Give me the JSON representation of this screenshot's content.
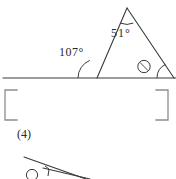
{
  "figure": {
    "part_label": "(4)",
    "triangle": {
      "apex_angle_label": "51°",
      "exterior_angle_label": "107°",
      "right_vertex_marker": "ⓑ",
      "apex": {
        "x": 127,
        "y": 8
      },
      "left_vertex": {
        "x": 97,
        "y": 78
      },
      "right_vertex": {
        "x": 172,
        "y": 78
      }
    },
    "baseline": {
      "x1": 3,
      "x2": 176,
      "y": 78
    },
    "bracket": {
      "left": 5,
      "right": 168,
      "top": 90,
      "bottom": 120
    },
    "next_figure": {
      "circled_number": "③",
      "line_start": {
        "x": 24,
        "y": 157
      },
      "line_end": {
        "x": 86,
        "y": 179
      }
    }
  }
}
